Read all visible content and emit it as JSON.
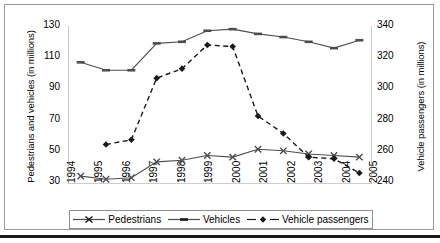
{
  "chart_data": {
    "type": "line",
    "title": "",
    "xlabel": "",
    "ylabel": "Pedestrians and vehicles (in millions)",
    "y2label": "Vehicle passengers (in millions)",
    "categories": [
      "1994",
      "1995",
      "1996",
      "1997",
      "1998",
      "1999",
      "2000",
      "2001",
      "2002",
      "2003",
      "2004",
      "2005"
    ],
    "ylim": [
      30,
      130
    ],
    "yticks": [
      30,
      50,
      70,
      90,
      110,
      130
    ],
    "y2lim": [
      240,
      340
    ],
    "y2ticks": [
      240,
      260,
      280,
      300,
      320,
      340
    ],
    "grid": false,
    "legend_position": "bottom",
    "series": [
      {
        "name": "Pedestrians",
        "axis": "left",
        "marker": "x",
        "linestyle": "solid",
        "color": "#4d4d4d",
        "values": [
          35,
          33,
          34,
          44,
          45,
          48,
          47,
          52,
          51,
          49,
          48,
          47
        ]
      },
      {
        "name": "Vehicles",
        "axis": "left",
        "marker": "dash",
        "linestyle": "solid",
        "color": "#4d4d4d",
        "values": [
          107,
          102,
          102,
          119,
          120,
          127,
          128,
          125,
          123,
          120,
          116,
          121
        ]
      },
      {
        "name": "Vehicle passengers",
        "axis": "right",
        "marker": "diamond",
        "linestyle": "dashed",
        "color": "#1a1a1a",
        "values": [
          null,
          265,
          268,
          307,
          313,
          328,
          327,
          283,
          272,
          257,
          256,
          247
        ]
      }
    ]
  },
  "axes": {
    "left_title": "Pedestrians and vehicles (in millions)",
    "right_title": "Vehicle passengers (in millions)",
    "left_ticks": [
      "130",
      "110",
      "90",
      "70",
      "50",
      "30"
    ],
    "right_ticks": [
      "340",
      "320",
      "300",
      "280",
      "260",
      "240"
    ],
    "x_ticks": [
      "1994",
      "1995",
      "1996",
      "1997",
      "1998",
      "1999",
      "2000",
      "2001",
      "2002",
      "2003",
      "2004",
      "2005"
    ]
  },
  "legend": {
    "items": [
      {
        "label": "Pedestrians",
        "marker": "x-marker",
        "style": "solid"
      },
      {
        "label": "Vehicles",
        "marker": "dash-marker",
        "style": "solid"
      },
      {
        "label": "Vehicle passengers",
        "marker": "diamond-marker",
        "style": "dashed"
      }
    ]
  },
  "colors": {
    "line": "#4d4d4d",
    "dashed_line": "#1a1a1a",
    "frame": "#9a9a9a",
    "rule": "#1a1a1a"
  }
}
